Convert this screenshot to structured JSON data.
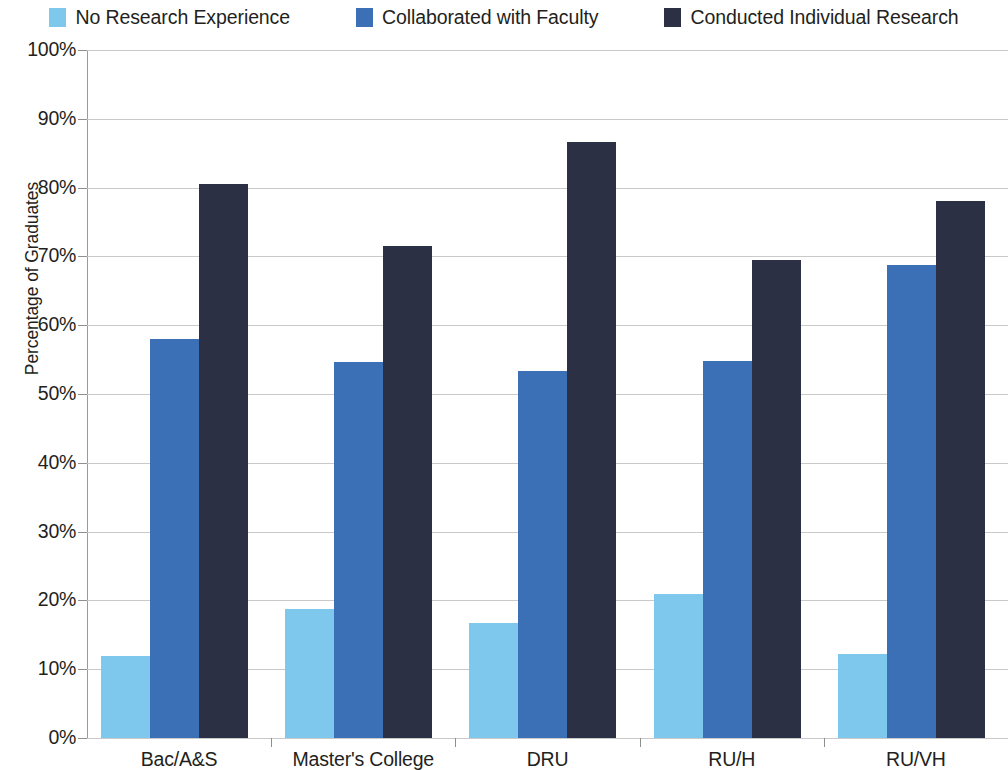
{
  "chart_data": {
    "type": "bar",
    "title": "",
    "subtitle": "",
    "xlabel": "",
    "ylabel": "Percentage of Graduates",
    "categories": [
      "Bac/A&S",
      "Master's College",
      "DRU",
      "RU/H",
      "RU/VH"
    ],
    "series": [
      {
        "name": "No Research Experience",
        "color": "#7EC8ED",
        "values": [
          11.9,
          18.7,
          16.7,
          20.9,
          12.2
        ]
      },
      {
        "name": "Collaborated with Faculty",
        "color": "#3B6FB6",
        "values": [
          58.0,
          54.6,
          53.3,
          54.8,
          68.8
        ]
      },
      {
        "name": "Conducted Individual Research",
        "color": "#2B3045",
        "values": [
          80.5,
          71.5,
          86.7,
          69.5,
          78.1
        ]
      }
    ],
    "ylim": [
      0,
      100
    ],
    "y_ticks": [
      "0%",
      "10%",
      "20%",
      "30%",
      "40%",
      "50%",
      "60%",
      "70%",
      "80%",
      "90%",
      "100%"
    ],
    "y_tick_values": [
      0,
      10,
      20,
      30,
      40,
      50,
      60,
      70,
      80,
      90,
      100
    ],
    "grid": true,
    "legend_position": "top",
    "value_labels": false
  },
  "legend": {
    "items": [
      {
        "label": "No Research Experience",
        "color": "#7EC8ED"
      },
      {
        "label": "Collaborated with Faculty",
        "color": "#3B6FB6"
      },
      {
        "label": "Conducted Individual Research",
        "color": "#2B3045"
      }
    ]
  },
  "axes": {
    "y_title": "Percentage of Graduates"
  }
}
